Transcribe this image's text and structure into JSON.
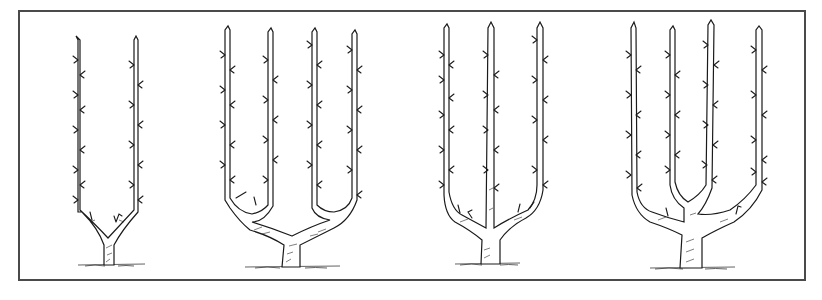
{
  "illustration": {
    "subject": "espalier tree training forms",
    "frame_color": "#4a4a4a",
    "ink_color": "#1a1a1a",
    "trees": [
      {
        "name": "single-u-espalier",
        "arms": 2
      },
      {
        "name": "double-u-espalier",
        "arms": 4
      },
      {
        "name": "triple-arm-espalier",
        "arms": 3
      },
      {
        "name": "quadruple-arm-espalier",
        "arms": 4
      }
    ]
  }
}
